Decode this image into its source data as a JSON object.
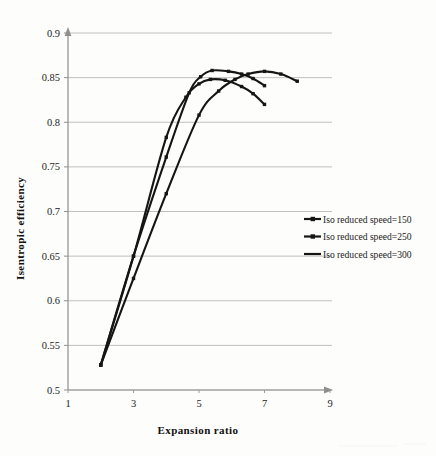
{
  "chart_data": {
    "type": "line",
    "title": "",
    "xlabel": "Expansion  ratio",
    "ylabel": "Isentropic efficiency",
    "xlim": [
      1,
      9
    ],
    "ylim": [
      0.5,
      0.9
    ],
    "xticks": [
      "1",
      "3",
      "5",
      "7",
      "9"
    ],
    "xtick_values": [
      1,
      3,
      5,
      7,
      9
    ],
    "yticks": [
      "0.5",
      "0.55",
      "0.6",
      "0.65",
      "0.7",
      "0.75",
      "0.8",
      "0.85",
      "0.9"
    ],
    "ytick_values": [
      0.5,
      0.55,
      0.6,
      0.65,
      0.7,
      0.75,
      0.8,
      0.85,
      0.9
    ],
    "grid": "horizontal",
    "legend_position": "right-center",
    "series": [
      {
        "name": "Iso reduced speed=150",
        "marker": "cross-line",
        "x": [
          2.0,
          3.0,
          4.0,
          4.6,
          5.0,
          5.35,
          5.8,
          6.3,
          6.65,
          7.0
        ],
        "y": [
          0.528,
          0.65,
          0.783,
          0.828,
          0.843,
          0.848,
          0.847,
          0.84,
          0.832,
          0.82
        ]
      },
      {
        "name": "Iso reduced speed=250",
        "marker": "square",
        "x": [
          2.0,
          3.0,
          4.0,
          4.7,
          5.05,
          5.4,
          5.9,
          6.3,
          6.65,
          7.0
        ],
        "y": [
          0.528,
          0.65,
          0.761,
          0.833,
          0.851,
          0.858,
          0.857,
          0.854,
          0.849,
          0.841
        ]
      },
      {
        "name": "Iso reduced speed=300",
        "marker": "line",
        "x": [
          2.0,
          3.0,
          4.0,
          5.0,
          5.6,
          6.1,
          6.5,
          7.0,
          7.5,
          8.0
        ],
        "y": [
          0.528,
          0.625,
          0.72,
          0.808,
          0.835,
          0.848,
          0.854,
          0.857,
          0.854,
          0.846
        ]
      }
    ]
  },
  "legend": {
    "items": [
      {
        "label": "Iso reduced speed=150"
      },
      {
        "label": "Iso reduced speed=250"
      },
      {
        "label": "Iso reduced speed=300"
      }
    ]
  },
  "colors": {
    "ink": "#151515",
    "grid": "#b9b9b9",
    "axis": "#8f8f8f",
    "paper": "#fdfdfb"
  }
}
